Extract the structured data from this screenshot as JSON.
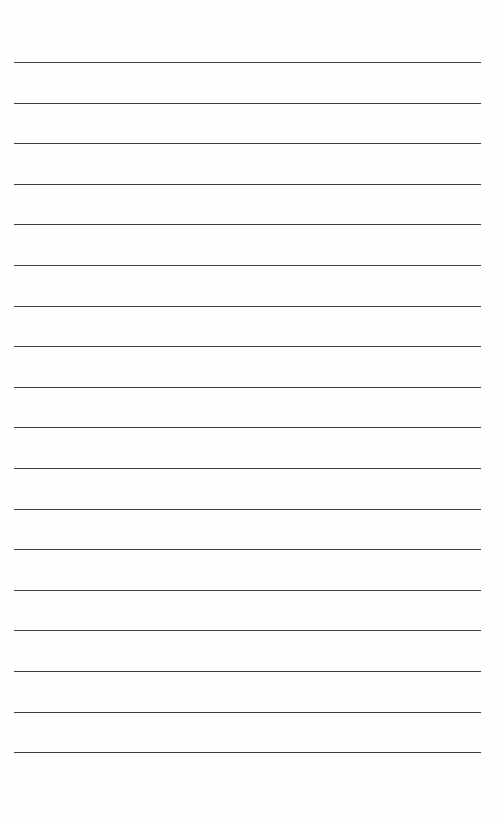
{
  "page": {
    "type": "blank lined paper",
    "line_count": 18,
    "line_color": "#3a3a3a",
    "background_color": "#fefefe",
    "first_line_y": 62,
    "line_spacing": 40.6,
    "line_left": 14,
    "line_width": 467
  }
}
